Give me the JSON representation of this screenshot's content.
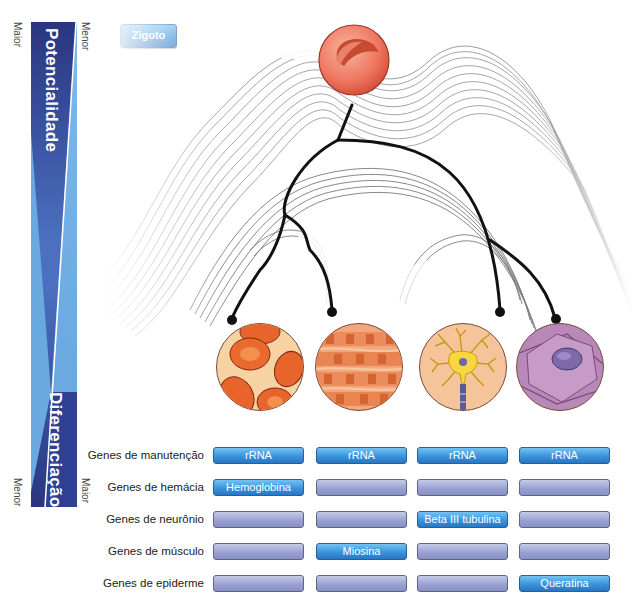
{
  "axis": {
    "potency_label": "Potencialidade",
    "differentiation_label": "Diferenciação",
    "top_left": "Maior",
    "top_right": "Menor",
    "bottom_left": "Menor",
    "bottom_right": "Maior"
  },
  "zygote": {
    "label": "Zigoto"
  },
  "cells": [
    {
      "name": "hemacia",
      "description": "red blood cells"
    },
    {
      "name": "musculo",
      "description": "muscle fibers"
    },
    {
      "name": "neuronio",
      "description": "neuron"
    },
    {
      "name": "epiderme",
      "description": "epidermal cell"
    }
  ],
  "gene_table": {
    "rows": [
      {
        "label": "Genes de manutenção",
        "cells": [
          "rRNA",
          "rRNA",
          "rRNA",
          "rRNA"
        ],
        "active": [
          true,
          true,
          true,
          true
        ]
      },
      {
        "label": "Genes de hemácia",
        "cells": [
          "Hemoglobina",
          "",
          "",
          ""
        ],
        "active": [
          true,
          false,
          false,
          false
        ]
      },
      {
        "label": "Genes de neurônio",
        "cells": [
          "",
          "",
          "Beta III tubulina",
          ""
        ],
        "active": [
          false,
          false,
          true,
          false
        ]
      },
      {
        "label": "Genes de músculo",
        "cells": [
          "",
          "Miosina",
          "",
          ""
        ],
        "active": [
          false,
          true,
          false,
          false
        ]
      },
      {
        "label": "Genes de epiderme",
        "cells": [
          "",
          "",
          "",
          "Queratina"
        ],
        "active": [
          false,
          false,
          false,
          true
        ]
      }
    ]
  },
  "colors": {
    "bar_dark": "#2b3a8c",
    "bar_light": "#6aa8e0",
    "button_active": "#3b93dc",
    "button_inactive": "#9ba2d2",
    "zygote": "#e8604a"
  }
}
